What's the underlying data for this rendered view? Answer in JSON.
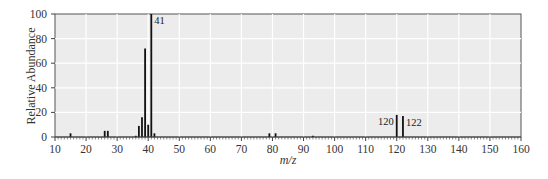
{
  "chart_data": {
    "type": "bar",
    "title": "",
    "xlabel": "m/z",
    "ylabel": "Relative Abundance",
    "xlim": [
      10,
      160
    ],
    "ylim": [
      0,
      100
    ],
    "xticks": [
      10,
      20,
      30,
      40,
      50,
      60,
      70,
      80,
      90,
      100,
      110,
      120,
      130,
      140,
      150,
      160
    ],
    "yticks": [
      0,
      20,
      40,
      60,
      80,
      100
    ],
    "grid": true,
    "legend": null,
    "x": [
      15,
      26,
      27,
      36,
      37,
      38,
      39,
      40,
      41,
      42,
      79,
      81,
      93,
      120,
      122
    ],
    "values": [
      3,
      5,
      5,
      1,
      9,
      16,
      72,
      10,
      100,
      3,
      3,
      3,
      1,
      18,
      17
    ],
    "annotations": [
      {
        "x": 41,
        "text": "41"
      },
      {
        "x": 120,
        "text": "120"
      },
      {
        "x": 122,
        "text": "122"
      }
    ]
  }
}
